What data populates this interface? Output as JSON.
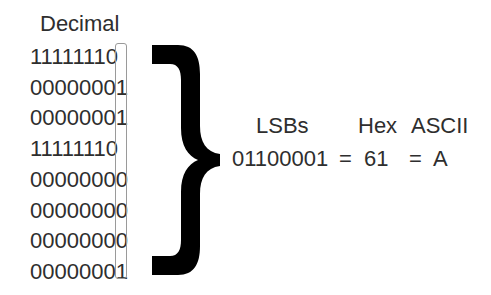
{
  "left_column": {
    "header": "Decimal",
    "rows": [
      "11111110",
      "00000001",
      "00000001",
      "11111110",
      "00000000",
      "00000000",
      "00000000",
      "00000001"
    ],
    "lsb_highlight": "bit-box"
  },
  "brace": {
    "icon": "right-curly-brace",
    "color": "#000000"
  },
  "right_column": {
    "headers": {
      "lsbs": "LSBs",
      "hex": "Hex",
      "ascii": "ASCII"
    },
    "values": {
      "binary": "01100001",
      "eq1": "=",
      "hex": "61",
      "eq2": "=",
      "ascii": "A"
    }
  },
  "colors": {
    "text": "#2e2e2e",
    "box_border": "#9a9a9a",
    "brace": "#000000",
    "background": "#ffffff"
  }
}
